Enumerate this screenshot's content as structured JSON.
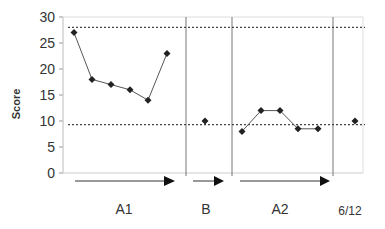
{
  "chart_data": {
    "type": "line",
    "title": "",
    "xlabel": "",
    "ylabel": "Score",
    "ylim": [
      0,
      30
    ],
    "yticks": [
      0,
      5,
      10,
      15,
      20,
      25,
      30
    ],
    "grid": false,
    "legend": null,
    "phases": [
      {
        "label": "A1",
        "points": [
          27,
          18,
          17,
          16,
          14,
          23
        ]
      },
      {
        "label": "B",
        "points": [
          10
        ]
      },
      {
        "label": "A2",
        "points": [
          8,
          12,
          12,
          8.5,
          8.5
        ]
      },
      {
        "label": "6/12",
        "points": [
          10
        ]
      }
    ],
    "series": [
      {
        "name": "Score",
        "values": [
          27,
          18,
          17,
          16,
          14,
          23,
          10,
          8,
          12,
          12,
          8.5,
          8.5,
          10
        ]
      }
    ],
    "reference_lines": [
      {
        "name": "upper",
        "value": 28,
        "style": "dotted"
      },
      {
        "name": "lower",
        "value": 9.3,
        "style": "dotted"
      }
    ],
    "annotations": [
      "A1",
      "B",
      "A2",
      "6/12"
    ]
  },
  "labels": {
    "ylabel": "Score",
    "phase_a1": "A1",
    "phase_b": "B",
    "phase_a2": "A2",
    "phase_followup": "6/12"
  }
}
